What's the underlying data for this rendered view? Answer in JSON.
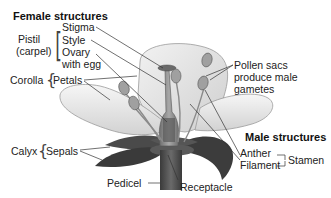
{
  "diagram": {
    "female_section": {
      "heading": "Female structures",
      "group_label_line1": "Pistil",
      "group_label_line2": "(carpel)",
      "parts": [
        "Stigma",
        "Style",
        "Ovary",
        "with egg"
      ]
    },
    "corolla": {
      "group_label": "Corolla",
      "part": "Petals"
    },
    "calyx": {
      "group_label": "Calyx",
      "part": "Sepals"
    },
    "pollen_note": {
      "line1": "Pollen sacs",
      "line2": "produce male",
      "line3": "gametes"
    },
    "male_section": {
      "heading": "Male structures",
      "parts": [
        "Anther",
        "Filament"
      ],
      "group_label": "Stamen"
    },
    "bottom_labels": {
      "pedicel": "Pedicel",
      "receptacle": "Receptacle"
    }
  },
  "colors": {
    "background": "#ffffff",
    "text": "#222222",
    "leader_line": "#333333",
    "petal_fill": "#ebebeb",
    "petal_stroke": "#9a9a9a",
    "sepal_fill": "#3c3c3c",
    "stem_fill": "#4a4a4a",
    "pistil_fill": "#8a8a8a",
    "anther_fill": "#a0a0a0"
  }
}
